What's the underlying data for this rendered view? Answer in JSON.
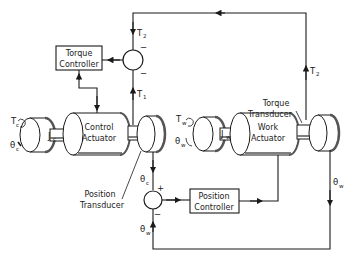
{
  "diagram": {
    "type": "block-diagram",
    "blocks": {
      "torque_controller": {
        "line1": "Torque",
        "line2": "Controller"
      },
      "position_controller": {
        "line1": "Position",
        "line2": "Controller"
      },
      "control_actuator": {
        "line1": "Control",
        "line2": "Actuator"
      },
      "work_actuator": {
        "line1": "Work",
        "line2": "Actuator"
      }
    },
    "annotations": {
      "torque_transducer": {
        "line1": "Torque",
        "line2": "Transducer"
      },
      "position_transducer": {
        "line1": "Position",
        "line2": "Transducer"
      }
    },
    "signals": {
      "T2_top": {
        "base": "T",
        "sub": "2"
      },
      "T2_right": {
        "base": "T",
        "sub": "2"
      },
      "T1": {
        "base": "T",
        "sub": "1"
      },
      "Tc": {
        "base": "T",
        "sub": "c"
      },
      "theta_c_left": {
        "base": "θ",
        "sub": "c"
      },
      "Jc": {
        "base": "J",
        "sub": "c"
      },
      "Tw": {
        "base": "T",
        "sub": "w"
      },
      "theta_w_left": {
        "base": "θ",
        "sub": "w"
      },
      "Jw": {
        "base": "J",
        "sub": "w"
      },
      "theta_c_down": {
        "base": "θ",
        "sub": "c"
      },
      "theta_w_right": {
        "base": "θ",
        "sub": "w"
      },
      "theta_w_up": {
        "base": "θ",
        "sub": "w"
      }
    },
    "summing_junctions": {
      "torque_sum": {
        "top_sign": "−",
        "bottom_sign": "−"
      },
      "position_sum": {
        "top_sign": "+",
        "bottom_sign": "−"
      }
    },
    "colors": {
      "line": "#1a1a1a",
      "background": "#ffffff",
      "shade": "#555555"
    }
  }
}
